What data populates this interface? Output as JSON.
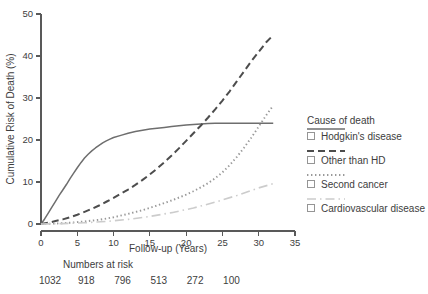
{
  "chart_data": {
    "type": "line",
    "title": "",
    "xlabel": "Follow-up (Years)",
    "ylabel": "Cumulative Risk of Death (%)",
    "xlim": [
      0,
      35
    ],
    "ylim": [
      0,
      50
    ],
    "xticks": [
      0,
      5,
      10,
      15,
      20,
      25,
      30,
      35
    ],
    "yticks": [
      0,
      10,
      20,
      30,
      40,
      50
    ],
    "grid": false,
    "legend_position": "right",
    "legend_title": "Cause of death",
    "series": [
      {
        "name": "Hodgkin's disease",
        "style": "solid",
        "color": "#6e6e6e",
        "x": [
          0,
          0.5,
          1,
          1.5,
          2,
          2.5,
          3,
          3.5,
          4,
          4.5,
          5,
          5.5,
          6,
          6.5,
          7,
          7.5,
          8,
          8.5,
          9,
          9.5,
          10,
          11,
          12,
          13,
          14,
          15,
          16,
          17,
          18,
          19,
          20,
          21,
          22,
          23,
          24,
          25,
          26,
          28,
          30,
          32
        ],
        "y": [
          0,
          1.2,
          2.6,
          4.0,
          5.4,
          6.8,
          8.1,
          9.4,
          10.8,
          12.1,
          13.4,
          14.6,
          15.7,
          16.6,
          17.4,
          18.1,
          18.7,
          19.3,
          19.8,
          20.2,
          20.6,
          21.1,
          21.6,
          22.0,
          22.3,
          22.6,
          22.8,
          23.0,
          23.2,
          23.4,
          23.6,
          23.7,
          23.8,
          23.9,
          24.0,
          24.0,
          24.0,
          24.0,
          24.0,
          24.0
        ]
      },
      {
        "name": "Other than HD",
        "style": "dashed",
        "color": "#4d4d4d",
        "x": [
          0,
          1,
          2,
          3,
          4,
          5,
          6,
          7,
          8,
          9,
          10,
          11,
          12,
          13,
          14,
          15,
          16,
          17,
          18,
          19,
          20,
          21,
          22,
          23,
          24,
          25,
          26,
          27,
          28,
          29,
          30,
          31,
          32
        ],
        "y": [
          0,
          0.3,
          0.7,
          1.1,
          1.6,
          2.2,
          2.9,
          3.6,
          4.4,
          5.3,
          6.2,
          7.2,
          8.2,
          9.3,
          10.5,
          11.8,
          13.2,
          14.7,
          16.3,
          18.0,
          19.8,
          21.6,
          23.4,
          25.3,
          27.3,
          29.4,
          31.6,
          34.0,
          36.4,
          38.8,
          41.0,
          43.2,
          45.0
        ]
      },
      {
        "name": "Second cancer",
        "style": "dotted",
        "color": "#999999",
        "x": [
          0,
          2,
          4,
          6,
          8,
          10,
          12,
          14,
          16,
          18,
          20,
          21,
          22,
          23,
          24,
          25,
          26,
          27,
          28,
          29,
          30,
          31,
          32
        ],
        "y": [
          0,
          0.1,
          0.3,
          0.6,
          1.0,
          1.6,
          2.4,
          3.3,
          4.4,
          5.6,
          7.0,
          7.8,
          8.7,
          9.7,
          10.9,
          12.3,
          14.0,
          16.0,
          18.2,
          20.6,
          23.2,
          25.8,
          28.2
        ]
      },
      {
        "name": "Cardiovascular disease",
        "style": "dashdot",
        "color": "#cccccc",
        "x": [
          0,
          3,
          6,
          9,
          12,
          15,
          18,
          21,
          24,
          27,
          30,
          32
        ],
        "y": [
          0,
          0.1,
          0.3,
          0.6,
          1.1,
          1.8,
          2.7,
          3.8,
          5.2,
          6.8,
          8.6,
          9.6
        ]
      }
    ],
    "numbers_at_risk": {
      "label": "Numbers at risk",
      "x_positions": [
        0,
        5,
        10,
        15,
        20,
        25
      ],
      "values": [
        "1032",
        "918",
        "796",
        "513",
        "272",
        "100"
      ]
    }
  },
  "legend": {
    "title": "Cause of death",
    "items": [
      {
        "label": "Hodgkin's disease"
      },
      {
        "label": "Other than HD"
      },
      {
        "label": "Second cancer"
      },
      {
        "label": "Cardiovascular disease"
      }
    ]
  },
  "axes": {
    "x_title": "Follow-up (Years)",
    "y_title": "Cumulative Risk of Death (%)",
    "x_tick_labels": [
      "0",
      "5",
      "10",
      "15",
      "20",
      "25",
      "30",
      "35"
    ],
    "y_tick_labels": [
      "0",
      "10",
      "20",
      "30",
      "40",
      "50"
    ]
  },
  "risk_table": {
    "title": "Numbers at risk",
    "values": [
      "1032",
      "918",
      "796",
      "513",
      "272",
      "100"
    ]
  },
  "colors": {
    "axis": "#595959",
    "text": "#3d3d3d",
    "series_solid": "#6e6e6e",
    "series_dashed": "#4d4d4d",
    "series_dotted": "#999999",
    "series_dashdot": "#cccccc"
  }
}
